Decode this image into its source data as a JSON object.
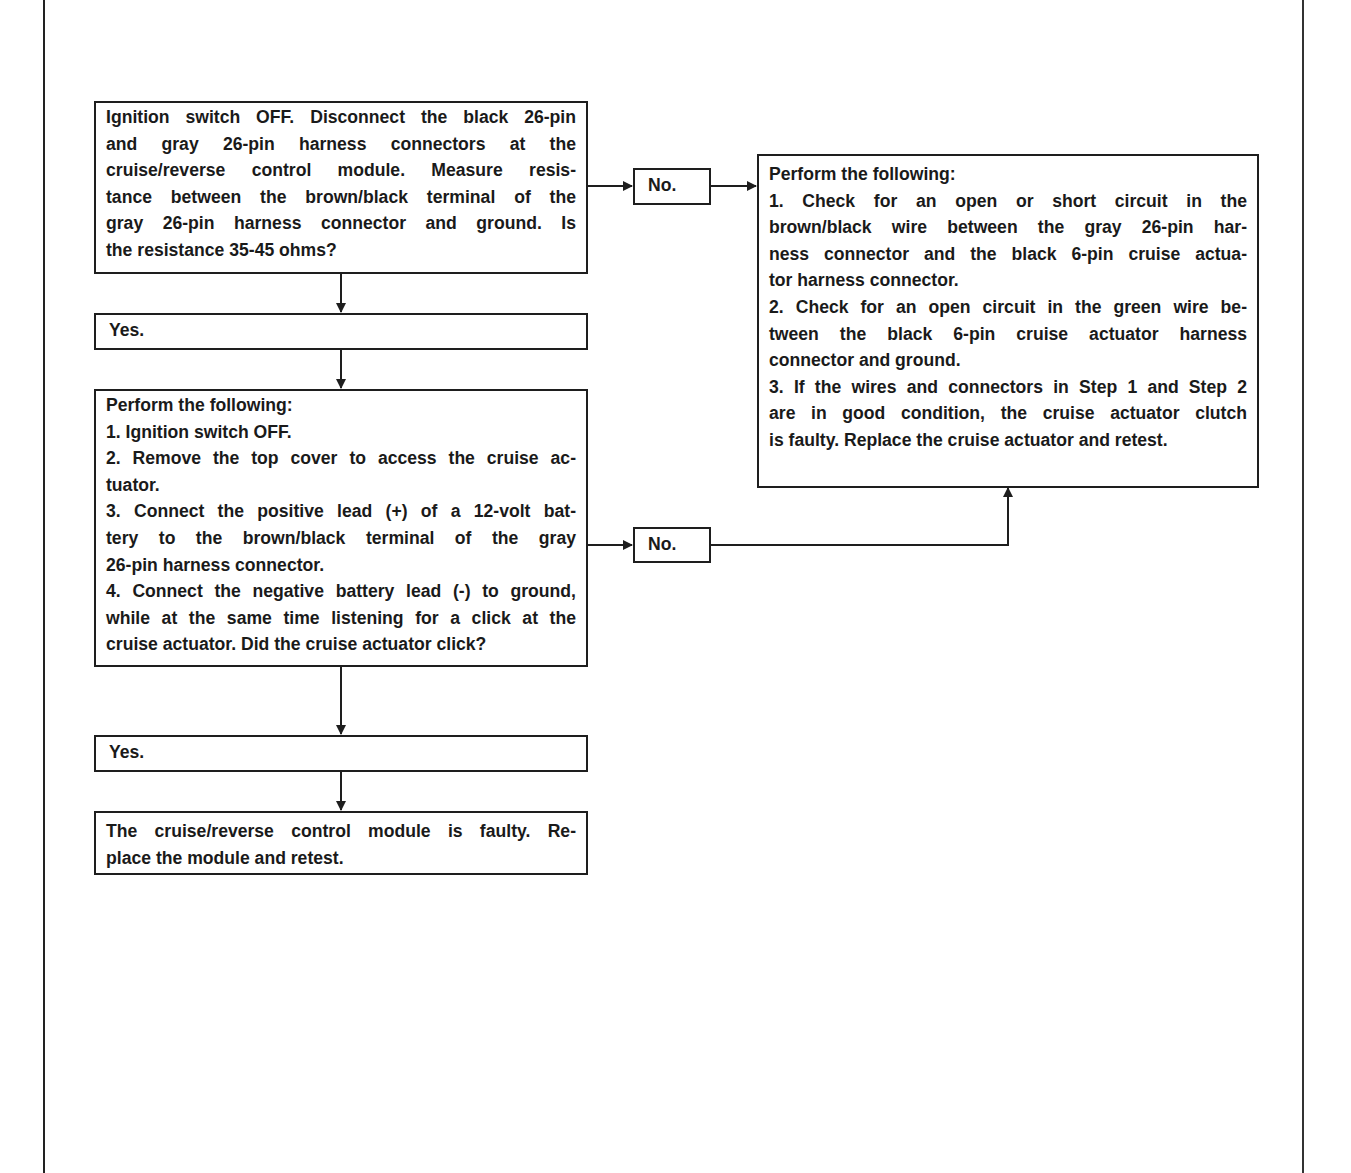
{
  "flowchart": {
    "step1": {
      "lines": [
        "Ignition switch OFF. Disconnect the black 26-pin",
        "and gray 26-pin harness connectors at the",
        "cruise/reverse control module. Measure resis-",
        "tance between the  brown/black terminal of the",
        "gray 26-pin  harness connector and ground. Is",
        "the resistance 35-45 ohms?"
      ]
    },
    "step1_yes": "Yes.",
    "step1_no": "No.",
    "step2": {
      "lines": [
        "Perform the following:",
        "1. Ignition switch OFF.",
        "2. Remove the top cover to access the cruise ac-",
        "tuator.",
        "3. Connect the positive lead (+) of a 12-volt bat-",
        "tery to the brown/black terminal of the gray",
        "26-pin harness connector.",
        "4. Connect the negative battery lead (-) to ground,",
        "while at the same time listening for a click at the",
        "cruise actuator. Did the cruise actuator click?"
      ]
    },
    "step2_yes": "Yes.",
    "step2_no": "No.",
    "result_module_faulty": {
      "lines": [
        "The cruise/reverse control module is faulty. Re-",
        "place the module and retest."
      ]
    },
    "result_wiring_check": {
      "lines": [
        "Perform the following:",
        "1. Check for an open or short circuit in the",
        "brown/black wire between the gray 26-pin  har-",
        "ness connector and the black 6-pin cruise actua-",
        "tor harness connector.",
        "2. Check for an open circuit in the green wire be-",
        "tween the black 6-pin cruise actuator harness",
        "connector and ground.",
        "3. If the wires and connectors in Step 1 and Step 2",
        "are in good condition, the cruise actuator clutch",
        "is faulty. Replace the cruise actuator and retest."
      ]
    }
  }
}
